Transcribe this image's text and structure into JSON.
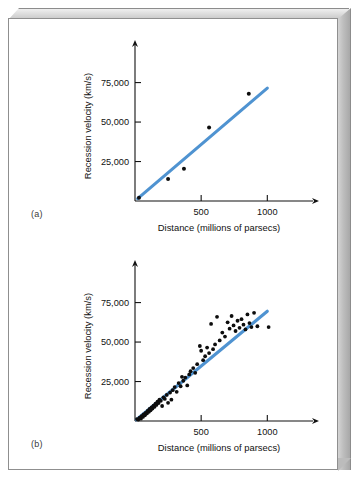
{
  "figure": {
    "background_color": "#ffffff",
    "frame_color": "#bdbdbd",
    "accent_color": "#4f93d1",
    "point_color": "#0d0d0d",
    "panels": [
      {
        "id": "a",
        "label": "(a)"
      },
      {
        "id": "b",
        "label": "(b)"
      }
    ]
  },
  "chart_data": [
    {
      "type": "scatter",
      "panel": "(a)",
      "title": "",
      "xlabel": "Distance (millions of parsecs)",
      "ylabel": "Recession velocity (km/s)",
      "xlim": [
        0,
        1300
      ],
      "ylim": [
        0,
        95000
      ],
      "xticks": [
        500,
        1000
      ],
      "xtick_labels": [
        "500",
        "1000"
      ],
      "yticks": [
        25000,
        50000,
        75000
      ],
      "ytick_labels": [
        "25,000",
        "50,000",
        "75,000"
      ],
      "grid": false,
      "legend": "none",
      "points": [
        {
          "x": 30,
          "y": 2000
        },
        {
          "x": 250,
          "y": 14000
        },
        {
          "x": 370,
          "y": 20500
        },
        {
          "x": 560,
          "y": 46500
        },
        {
          "x": 860,
          "y": 68000
        }
      ],
      "fit_line": {
        "x": [
          20,
          1000
        ],
        "y": [
          1500,
          71500
        ],
        "color": "#4f93d1",
        "label": "Hubble law fit"
      }
    },
    {
      "type": "scatter",
      "panel": "(b)",
      "title": "",
      "xlabel": "Distance (millions of parsecs)",
      "ylabel": "Recession velocity (km/s)",
      "xlim": [
        0,
        1300
      ],
      "ylim": [
        0,
        95000
      ],
      "xticks": [
        500,
        1000
      ],
      "xtick_labels": [
        "500",
        "1000"
      ],
      "yticks": [
        25000,
        50000,
        75000
      ],
      "ytick_labels": [
        "25,000",
        "50,000",
        "75,000"
      ],
      "grid": false,
      "legend": "none",
      "points": [
        {
          "x": 15,
          "y": 1200
        },
        {
          "x": 25,
          "y": 900
        },
        {
          "x": 35,
          "y": 2200
        },
        {
          "x": 45,
          "y": 1500
        },
        {
          "x": 50,
          "y": 3000
        },
        {
          "x": 60,
          "y": 2600
        },
        {
          "x": 65,
          "y": 4200
        },
        {
          "x": 75,
          "y": 3600
        },
        {
          "x": 80,
          "y": 5200
        },
        {
          "x": 90,
          "y": 4800
        },
        {
          "x": 95,
          "y": 6400
        },
        {
          "x": 105,
          "y": 5800
        },
        {
          "x": 110,
          "y": 7600
        },
        {
          "x": 118,
          "y": 6800
        },
        {
          "x": 125,
          "y": 8600
        },
        {
          "x": 132,
          "y": 7900
        },
        {
          "x": 140,
          "y": 9800
        },
        {
          "x": 148,
          "y": 9000
        },
        {
          "x": 155,
          "y": 11000
        },
        {
          "x": 162,
          "y": 10200
        },
        {
          "x": 170,
          "y": 12200
        },
        {
          "x": 178,
          "y": 11400
        },
        {
          "x": 185,
          "y": 13600
        },
        {
          "x": 195,
          "y": 12800
        },
        {
          "x": 205,
          "y": 9500
        },
        {
          "x": 215,
          "y": 15000
        },
        {
          "x": 225,
          "y": 14000
        },
        {
          "x": 240,
          "y": 16500
        },
        {
          "x": 250,
          "y": 11500
        },
        {
          "x": 265,
          "y": 18000
        },
        {
          "x": 275,
          "y": 13500
        },
        {
          "x": 285,
          "y": 19500
        },
        {
          "x": 300,
          "y": 21500
        },
        {
          "x": 315,
          "y": 18500
        },
        {
          "x": 330,
          "y": 24000
        },
        {
          "x": 345,
          "y": 22000
        },
        {
          "x": 355,
          "y": 28000
        },
        {
          "x": 365,
          "y": 25500
        },
        {
          "x": 380,
          "y": 27500
        },
        {
          "x": 395,
          "y": 22500
        },
        {
          "x": 410,
          "y": 29500
        },
        {
          "x": 420,
          "y": 31500
        },
        {
          "x": 440,
          "y": 33500
        },
        {
          "x": 455,
          "y": 30500
        },
        {
          "x": 470,
          "y": 36000
        },
        {
          "x": 490,
          "y": 47500
        },
        {
          "x": 500,
          "y": 44500
        },
        {
          "x": 515,
          "y": 38500
        },
        {
          "x": 530,
          "y": 41000
        },
        {
          "x": 545,
          "y": 46500
        },
        {
          "x": 560,
          "y": 43000
        },
        {
          "x": 575,
          "y": 61500
        },
        {
          "x": 590,
          "y": 45500
        },
        {
          "x": 605,
          "y": 48500
        },
        {
          "x": 620,
          "y": 66000
        },
        {
          "x": 640,
          "y": 51000
        },
        {
          "x": 660,
          "y": 56000
        },
        {
          "x": 680,
          "y": 53500
        },
        {
          "x": 700,
          "y": 62500
        },
        {
          "x": 715,
          "y": 58500
        },
        {
          "x": 730,
          "y": 66500
        },
        {
          "x": 745,
          "y": 60500
        },
        {
          "x": 760,
          "y": 57000
        },
        {
          "x": 775,
          "y": 63500
        },
        {
          "x": 790,
          "y": 59000
        },
        {
          "x": 805,
          "y": 64500
        },
        {
          "x": 820,
          "y": 61000
        },
        {
          "x": 835,
          "y": 58000
        },
        {
          "x": 850,
          "y": 67500
        },
        {
          "x": 865,
          "y": 62000
        },
        {
          "x": 880,
          "y": 59500
        },
        {
          "x": 900,
          "y": 68500
        },
        {
          "x": 925,
          "y": 60000
        },
        {
          "x": 1010,
          "y": 59500
        }
      ],
      "fit_line": {
        "x": [
          10,
          1000
        ],
        "y": [
          800,
          69500
        ],
        "color": "#4f93d1",
        "label": "Hubble law fit"
      }
    }
  ]
}
